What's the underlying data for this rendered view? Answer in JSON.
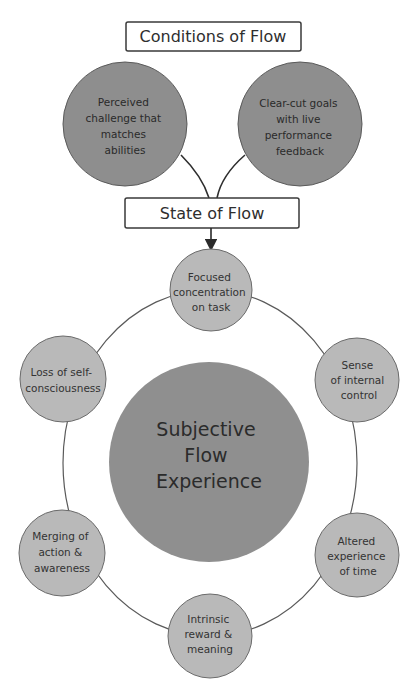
{
  "diagram": {
    "title_box": "Conditions of Flow",
    "conditions": [
      {
        "lines": [
          "Perceived",
          "challenge that",
          "matches",
          "abilities"
        ]
      },
      {
        "lines": [
          "Clear-cut goals",
          "with live",
          "performance",
          "feedback"
        ]
      }
    ],
    "state_box": "State of Flow",
    "center": {
      "lines": [
        "Subjective",
        "Flow",
        "Experience"
      ]
    },
    "outcomes": [
      {
        "id": "focused",
        "lines": [
          "Focused",
          "concentration",
          "on task"
        ]
      },
      {
        "id": "internal-control",
        "lines": [
          "Sense",
          "of internal",
          "control"
        ]
      },
      {
        "id": "altered-time",
        "lines": [
          "Altered",
          "experience",
          "of time"
        ]
      },
      {
        "id": "intrinsic-reward",
        "lines": [
          "Intrinsic",
          "reward &",
          "meaning"
        ]
      },
      {
        "id": "merging",
        "lines": [
          "Merging of",
          "action &",
          "awareness"
        ]
      },
      {
        "id": "self-consciousness",
        "lines": [
          "Loss of self-",
          "consciousness"
        ]
      }
    ],
    "colors": {
      "condition_fill": "#8e8e8e",
      "center_fill": "#8f8f8f",
      "outcome_fill": "#b9b9b9",
      "stroke": "#3a3a3a",
      "ring": "#5a5a5a"
    }
  }
}
